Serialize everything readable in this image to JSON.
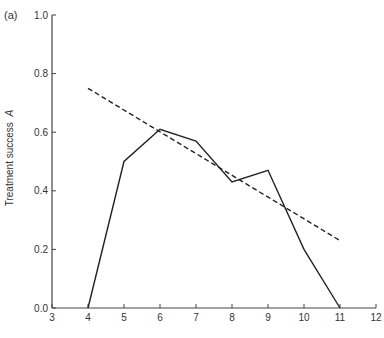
{
  "panel_label": "(a)",
  "chart_data": {
    "type": "line",
    "title": "",
    "xlabel": "",
    "ylabel": "Treatment success",
    "ylabel_var": "A",
    "xlim": [
      3,
      12
    ],
    "ylim": [
      0.0,
      1.0
    ],
    "xticks": [
      3,
      4,
      5,
      6,
      7,
      8,
      9,
      10,
      11,
      12
    ],
    "yticks": [
      0.0,
      0.2,
      0.4,
      0.6,
      0.8,
      1.0
    ],
    "ytick_labels": [
      "0.0",
      "0.2",
      "0.4",
      "0.6",
      "0.8",
      "1.0"
    ],
    "grid": false,
    "legend": null,
    "series": [
      {
        "name": "observed",
        "style": "solid",
        "color": "#222222",
        "x": [
          4,
          5,
          6,
          7,
          8,
          9,
          10,
          11
        ],
        "values": [
          0.0,
          0.5,
          0.61,
          0.57,
          0.43,
          0.47,
          0.2,
          0.0
        ]
      },
      {
        "name": "trend",
        "style": "dashed",
        "color": "#222222",
        "x": [
          4,
          11
        ],
        "values": [
          0.75,
          0.23
        ]
      }
    ]
  }
}
